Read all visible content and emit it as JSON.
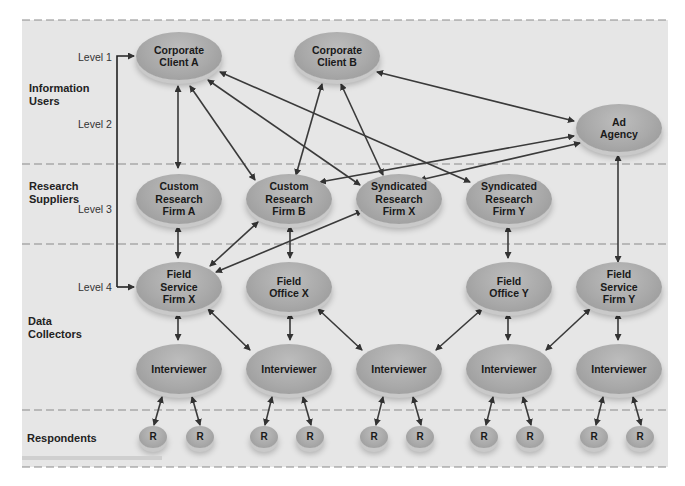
{
  "colors": {
    "background": "#e6e6e6",
    "node_fill": "#aaaaaa",
    "arrow": "#3a3a3a",
    "divider": "#8a8a8a"
  },
  "bands": [
    {
      "id": "info",
      "label": "Information\nUsers",
      "lines": [
        "Information",
        "Users"
      ]
    },
    {
      "id": "research",
      "label": "Research\nSuppliers",
      "lines": [
        "Research",
        "Suppliers"
      ]
    },
    {
      "id": "data",
      "label": "Data\nCollectors",
      "lines": [
        "Data",
        "Collectors"
      ]
    },
    {
      "id": "resp",
      "label": "Respondents",
      "lines": [
        "Respondents"
      ]
    }
  ],
  "levels": [
    "Level 1",
    "Level 2",
    "Level 3",
    "Level 4"
  ],
  "nodes": {
    "corp_a": {
      "lines": [
        "Corporate",
        "Client A"
      ]
    },
    "corp_b": {
      "lines": [
        "Corporate",
        "Client B"
      ]
    },
    "ad_agency": {
      "lines": [
        "Ad",
        "Agency"
      ]
    },
    "custom_a": {
      "lines": [
        "Custom",
        "Research",
        "Firm A"
      ]
    },
    "custom_b": {
      "lines": [
        "Custom",
        "Research",
        "Firm B"
      ]
    },
    "synd_x": {
      "lines": [
        "Syndicated",
        "Research",
        "Firm X"
      ]
    },
    "synd_y": {
      "lines": [
        "Syndicated",
        "Research",
        "Firm Y"
      ]
    },
    "field_svc_x": {
      "lines": [
        "Field",
        "Service",
        "Firm X"
      ]
    },
    "field_off_x": {
      "lines": [
        "Field",
        "Office X"
      ]
    },
    "field_off_y": {
      "lines": [
        "Field",
        "Office Y"
      ]
    },
    "field_svc_y": {
      "lines": [
        "Field",
        "Service",
        "Firm Y"
      ]
    },
    "interviewer_label": "Interviewer",
    "respondent_label": "R"
  }
}
